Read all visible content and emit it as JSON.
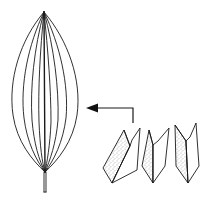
{
  "figure": {
    "type": "botanical-line-drawing",
    "subjects": [
      {
        "name": "leaf",
        "description": "Elliptic leaf with parallel (arcuate) venation and short petiole"
      },
      {
        "name": "folded-leaf-sections",
        "count": 3,
        "description": "Three conduplicate folded leaf cross-section views with stippled inner faces"
      }
    ],
    "arrow": {
      "direction": "left",
      "points_from": "folded-leaf-sections",
      "points_to": "leaf"
    },
    "colors": {
      "background": "#ffffff",
      "stroke": "#1a1a1a",
      "stipple": "#555555"
    }
  }
}
